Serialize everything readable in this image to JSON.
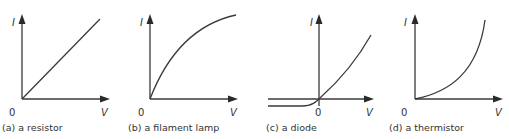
{
  "figure": {
    "panels": [
      {
        "id": "a",
        "caption": "(a) a resistor",
        "y_label": "I",
        "x_label": "V",
        "origin_label": "0",
        "curve": "linear"
      },
      {
        "id": "b",
        "caption": "(b) a filament lamp",
        "y_label": "I",
        "x_label": "V",
        "origin_label": "0",
        "curve": "concave-down"
      },
      {
        "id": "c",
        "caption": "(c) a diode",
        "y_label": "I",
        "x_label": "V",
        "origin_label": "0",
        "curve": "diode"
      },
      {
        "id": "d",
        "caption": "(d) a thermistor",
        "y_label": "I",
        "x_label": "V",
        "origin_label": "0",
        "curve": "concave-up"
      }
    ],
    "colors": {
      "line": "#3a3a3a",
      "text": "#333333",
      "background": "#ffffff"
    }
  }
}
